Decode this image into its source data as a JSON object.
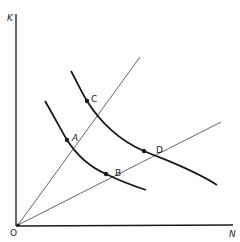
{
  "diagram": {
    "axes": {
      "y_label": "K",
      "x_label": "N",
      "origin_label": "O"
    },
    "points": [
      {
        "label": "A",
        "x": 67,
        "y": 140
      },
      {
        "label": "B",
        "x": 106,
        "y": 174
      },
      {
        "label": "C",
        "x": 87,
        "y": 101
      },
      {
        "label": "D",
        "x": 144,
        "y": 151
      }
    ],
    "rays": [
      {
        "name": "steep-ray",
        "through": [
          "A",
          "C"
        ]
      },
      {
        "name": "shallow-ray",
        "through": [
          "B",
          "D"
        ]
      }
    ],
    "curves": [
      {
        "name": "inner-isoquant",
        "through": [
          "A",
          "B"
        ]
      },
      {
        "name": "outer-isoquant",
        "through": [
          "C",
          "D"
        ]
      }
    ],
    "colors": {
      "line": "#1a1a1a",
      "ray": "#555555",
      "background": "#ffffff"
    }
  }
}
